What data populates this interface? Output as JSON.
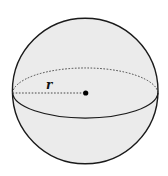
{
  "diagram": {
    "type": "sphere",
    "radius_label": "r",
    "colors": {
      "background": "#ffffff",
      "sphere_fill": "#ebebeb",
      "stroke": "#1a1a1a",
      "dashed": "#333333",
      "center_dot": "#000000"
    },
    "elements": [
      {
        "name": "sphere-outline",
        "shape": "circle"
      },
      {
        "name": "equator-back",
        "shape": "dashed half-ellipse"
      },
      {
        "name": "equator-front",
        "shape": "solid half-ellipse"
      },
      {
        "name": "radius-line",
        "shape": "dashed line",
        "label": "r"
      },
      {
        "name": "center-point",
        "shape": "dot"
      }
    ]
  }
}
